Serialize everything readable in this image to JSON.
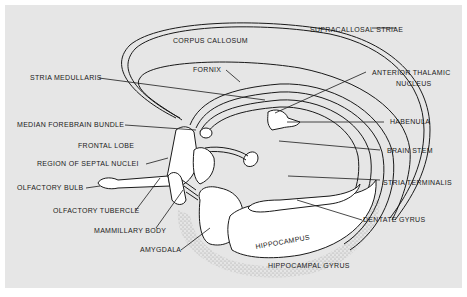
{
  "figure": {
    "background_color": "#e6e6e6",
    "line_color": "#1a1a1a",
    "fill_color": "#ffffff"
  },
  "labels": {
    "corpus_callosum": "CORPUS CALLOSUM",
    "supracallosal_striae": "SUPRACALLOSAL STRIAE",
    "fornix": "FORNIX",
    "stria_medullaris": "STRIA MEDULLARIS",
    "anterior_thalamic_1": "ANTERIOR THALAMIC",
    "anterior_thalamic_2": "NUCLEUS",
    "median_forebrain_bundle": "MEDIAN FOREBRAIN BUNDLE",
    "habenula": "HABENULA",
    "frontal_lobe": "FRONTAL LOBE",
    "brain_stem": "BRAIN STEM",
    "region_septal_nuclei": "REGION OF SEPTAL NUCLEI",
    "stria_terminalis": "STRIA TERMINALIS",
    "olfactory_bulb": "OLFACTORY BULB",
    "olfactory_tubercle": "OLFACTORY TUBERCLE",
    "dentate_gyrus": "DENTATE GYRUS",
    "mammillary_body": "MAMMILLARY BODY",
    "hippocampus": "HIPPOCAMPUS",
    "amygdala": "AMYGDALA",
    "hippocampal_gyrus": "HIPPOCAMPAL GYRUS"
  }
}
